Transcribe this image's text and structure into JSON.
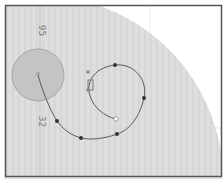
{
  "diagram": {
    "type": "path-on-map",
    "colors": {
      "background": "#ffffff",
      "region_fill": "#dcdcdc",
      "frame_border": "#555555",
      "grid": "#c8c8c8",
      "circle_fill": "#c4c4c4",
      "circle_stroke": "#8a8a8a",
      "path_stroke": "#5a5a5a",
      "point_fill": "#333333",
      "end_point_fill": "#ffffff"
    },
    "labels": [
      {
        "id": "label-top",
        "text": "95",
        "x": 40,
        "y": 31
      },
      {
        "id": "label-bottom",
        "text": "32",
        "x": 40,
        "y": 122
      }
    ],
    "shaded_circle": {
      "cx": 38,
      "cy": 75,
      "r": 26
    },
    "path_points": [
      {
        "x": 116,
        "y": 119,
        "kind": "end"
      },
      {
        "x": 90,
        "y": 89,
        "kind": "node"
      },
      {
        "x": 90,
        "y": 78,
        "kind": "node"
      },
      {
        "x": 88,
        "y": 72,
        "kind": "node"
      },
      {
        "x": 115,
        "y": 65,
        "kind": "node"
      },
      {
        "x": 144,
        "y": 98,
        "kind": "node"
      },
      {
        "x": 117,
        "y": 134,
        "kind": "node"
      },
      {
        "x": 81,
        "y": 138,
        "kind": "node"
      },
      {
        "x": 57,
        "y": 121,
        "kind": "node"
      },
      {
        "x": 38,
        "y": 75,
        "kind": "origin"
      }
    ]
  }
}
